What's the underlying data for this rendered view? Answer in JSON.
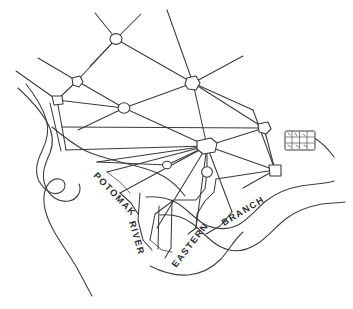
{
  "map": {
    "title": "Hand-drawn sketch map of Washington D.C. street plan",
    "background_color": "#ffffff",
    "ink_color": "#3a3a3c",
    "labels": {
      "potomac_river": {
        "line1": "POTOMAK",
        "line2": "RIVER"
      },
      "eastern_branch": {
        "line1": "EASTERN",
        "line2": "BRANCH"
      }
    },
    "features": {
      "grid_inset_label": "",
      "river_potomac_name": "POTOMAK RIVER",
      "river_anacostia_name": "EASTERN BRANCH"
    },
    "nodes": [
      {
        "id": "n-top",
        "x": 116,
        "y": 39,
        "rx": 6.0,
        "ry": 5.4,
        "shape": "circle"
      },
      {
        "id": "n-upper-left",
        "x": 77,
        "y": 81,
        "rx": 5.2,
        "ry": 5.0,
        "shape": "polygon"
      },
      {
        "id": "n-west",
        "x": 57,
        "y": 100,
        "rx": 5.0,
        "ry": 5.0,
        "shape": "polygon"
      },
      {
        "id": "n-mid-left",
        "x": 124,
        "y": 108,
        "rx": 5.8,
        "ry": 5.2,
        "shape": "circle"
      },
      {
        "id": "n-upper-right",
        "x": 193,
        "y": 83,
        "rx": 6.6,
        "ry": 6.2,
        "shape": "polygon"
      },
      {
        "id": "n-hub",
        "x": 207,
        "y": 146,
        "rx": 9.0,
        "ry": 6.6,
        "shape": "polygon"
      },
      {
        "id": "n-small-hub",
        "x": 207,
        "y": 172,
        "rx": 5.4,
        "ry": 5.2,
        "shape": "circle"
      },
      {
        "id": "n-mid-small",
        "x": 167,
        "y": 165,
        "rx": 4.4,
        "ry": 3.8,
        "shape": "circle"
      },
      {
        "id": "n-east",
        "x": 264,
        "y": 128,
        "rx": 6.2,
        "ry": 5.8,
        "shape": "polygon"
      },
      {
        "id": "n-southeast",
        "x": 275,
        "y": 170,
        "rx": 5.6,
        "ry": 5.4,
        "shape": "polygon"
      }
    ],
    "inset_grid": {
      "x": 285,
      "y": 131,
      "width": 30,
      "height": 19,
      "rows": 3,
      "cols": 4
    }
  }
}
